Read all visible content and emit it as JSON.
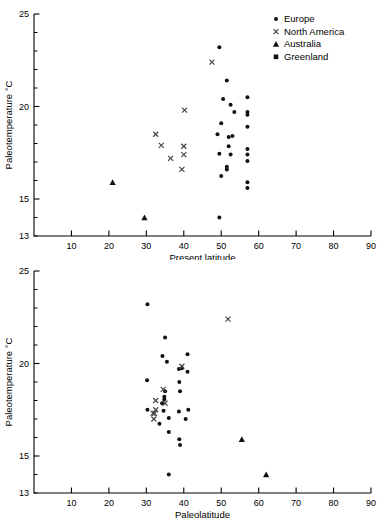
{
  "figure": {
    "legend": {
      "position": "top-right",
      "entries": [
        {
          "label": "Europe",
          "marker": "dot-icon"
        },
        {
          "label": "North America",
          "marker": "cross-icon"
        },
        {
          "label": "Australia",
          "marker": "triangle-icon"
        },
        {
          "label": "Greenland",
          "marker": "square-icon"
        }
      ]
    }
  },
  "chart_data": [
    {
      "type": "scatter",
      "title": "",
      "xlabel": "Present latitude",
      "ylabel": "Paleotemperature °C",
      "xlim": [
        0,
        90
      ],
      "ylim": [
        13,
        25
      ],
      "xticks": [
        10,
        20,
        30,
        40,
        50,
        60,
        70,
        80,
        90
      ],
      "yticks": [
        15,
        20,
        25
      ],
      "y_minor_step": 1,
      "ytick_min_label": "13",
      "grid": false,
      "series": [
        {
          "name": "Europe",
          "marker": "dot",
          "points": [
            [
              49.5,
              23.2
            ],
            [
              51.5,
              21.4
            ],
            [
              57.0,
              20.5
            ],
            [
              50.5,
              20.4
            ],
            [
              52.5,
              20.1
            ],
            [
              53.5,
              19.7
            ],
            [
              57.0,
              19.7
            ],
            [
              57.0,
              19.55
            ],
            [
              50.0,
              19.1
            ],
            [
              57.0,
              18.9
            ],
            [
              49.0,
              18.5
            ],
            [
              53.0,
              18.4
            ],
            [
              52.0,
              18.35
            ],
            [
              52.0,
              17.85
            ],
            [
              57.0,
              17.7
            ],
            [
              57.0,
              17.4
            ],
            [
              49.5,
              17.45
            ],
            [
              52.5,
              17.4
            ],
            [
              57.0,
              17.05
            ],
            [
              51.5,
              16.75
            ],
            [
              51.5,
              16.6
            ],
            [
              50.0,
              16.25
            ],
            [
              57.0,
              15.9
            ],
            [
              57.0,
              15.6
            ],
            [
              49.5,
              14.0
            ]
          ]
        },
        {
          "name": "North America",
          "marker": "cross",
          "points": [
            [
              47.5,
              22.4
            ],
            [
              40.2,
              19.8
            ],
            [
              32.5,
              18.5
            ],
            [
              34.0,
              17.9
            ],
            [
              40.0,
              17.85
            ],
            [
              40.0,
              17.4
            ],
            [
              36.5,
              17.2
            ],
            [
              39.5,
              16.6
            ]
          ]
        },
        {
          "name": "Australia",
          "marker": "triangle",
          "points": [
            [
              21.0,
              15.9
            ],
            [
              29.5,
              14.0
            ]
          ]
        },
        {
          "name": "Greenland",
          "marker": "square",
          "points": []
        }
      ]
    },
    {
      "type": "scatter",
      "title": "",
      "xlabel": "Paleolatitude",
      "ylabel": "Paleotemperature °C",
      "xlim": [
        0,
        90
      ],
      "ylim": [
        13,
        25
      ],
      "xticks": [
        10,
        20,
        30,
        40,
        50,
        60,
        70,
        80,
        90
      ],
      "yticks": [
        15,
        20,
        25
      ],
      "y_minor_step": 1,
      "ytick_min_label": "13",
      "grid": false,
      "series": [
        {
          "name": "Europe",
          "marker": "dot",
          "points": [
            [
              30.3,
              23.2
            ],
            [
              35.0,
              21.4
            ],
            [
              41.0,
              20.5
            ],
            [
              34.3,
              20.4
            ],
            [
              35.5,
              20.1
            ],
            [
              38.7,
              19.7
            ],
            [
              39.5,
              19.75
            ],
            [
              41.0,
              19.55
            ],
            [
              30.2,
              19.1
            ],
            [
              38.8,
              19.0
            ],
            [
              35.0,
              18.5
            ],
            [
              39.0,
              18.5
            ],
            [
              34.8,
              18.2
            ],
            [
              34.8,
              18.05
            ],
            [
              34.2,
              17.85
            ],
            [
              30.3,
              17.5
            ],
            [
              41.2,
              17.5
            ],
            [
              34.6,
              17.45
            ],
            [
              38.7,
              17.4
            ],
            [
              36.0,
              17.05
            ],
            [
              40.5,
              17.0
            ],
            [
              33.5,
              16.75
            ],
            [
              36.0,
              16.3
            ],
            [
              38.8,
              15.9
            ],
            [
              39.0,
              15.6
            ],
            [
              36.0,
              14.0
            ]
          ]
        },
        {
          "name": "North America",
          "marker": "cross",
          "points": [
            [
              51.8,
              22.4
            ],
            [
              39.5,
              19.85
            ],
            [
              34.5,
              18.6
            ],
            [
              32.5,
              18.0
            ],
            [
              35.0,
              17.85
            ],
            [
              32.5,
              17.5
            ],
            [
              31.8,
              17.3
            ],
            [
              32.2,
              17.3
            ],
            [
              32.0,
              17.0
            ]
          ]
        },
        {
          "name": "Australia",
          "marker": "triangle",
          "points": [
            [
              55.5,
              15.9
            ],
            [
              62.0,
              14.0
            ]
          ]
        },
        {
          "name": "Greenland",
          "marker": "square",
          "points": []
        }
      ]
    }
  ]
}
